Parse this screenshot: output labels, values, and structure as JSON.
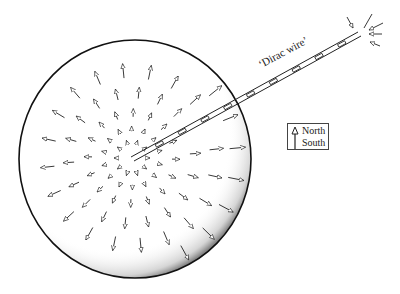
{
  "diagram": {
    "title": "",
    "sphere": {
      "center": [
        135,
        159
      ],
      "radius_x": 116,
      "radius_y": 119,
      "stipple": "shaded lower-right edge"
    },
    "field": {
      "type": "radial-outward-arrows",
      "description": "magnetic field arrows pointing radially outward from monopole at center"
    },
    "wire": {
      "label": "‘Dirac wire’",
      "start": [
        132,
        158
      ],
      "end": [
        360,
        34
      ],
      "end_arrows": "inward-pointing arrows converging at wire tip"
    },
    "legend": {
      "north_label": "North",
      "south_label": "South",
      "symbol": "arrow-icon"
    },
    "colors": {
      "ink": "#222222",
      "background": "#ffffff"
    }
  }
}
